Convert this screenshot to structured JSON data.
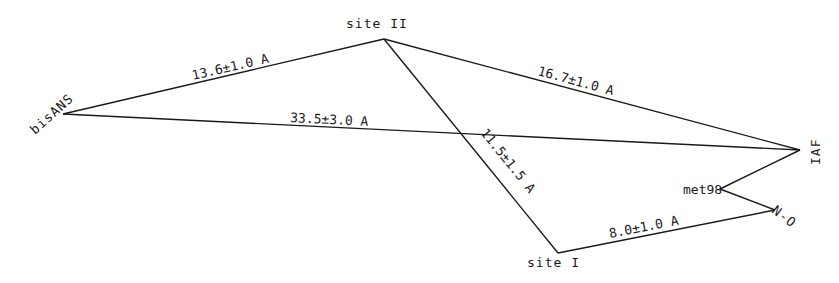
{
  "diagram": {
    "nodes": [
      {
        "id": "bisANS",
        "label": "bisANS",
        "x": 63,
        "y": 114
      },
      {
        "id": "siteII",
        "label": "site II",
        "x": 384,
        "y": 39
      },
      {
        "id": "IAF",
        "label": "IAF",
        "x": 800,
        "y": 150
      },
      {
        "id": "met98",
        "label": "met98",
        "x": 720,
        "y": 189
      },
      {
        "id": "NO",
        "label": "N-O",
        "x": 775,
        "y": 210
      },
      {
        "id": "siteI",
        "label": "site I",
        "x": 558,
        "y": 253
      }
    ],
    "edges": [
      {
        "from": "bisANS",
        "to": "siteII",
        "label": "13.6±1.0 A"
      },
      {
        "from": "siteII",
        "to": "IAF",
        "label": "16.7±1.0 A"
      },
      {
        "from": "bisANS",
        "to": "IAF",
        "label": "33.5±3.0 A"
      },
      {
        "from": "siteII",
        "to": "siteI",
        "label": "11.5±1.5 A"
      },
      {
        "from": "siteI",
        "to": "NO",
        "label": "8.0±1.0 A"
      },
      {
        "from": "IAF",
        "to": "met98",
        "label": ""
      },
      {
        "from": "met98",
        "to": "NO",
        "label": ""
      }
    ]
  }
}
